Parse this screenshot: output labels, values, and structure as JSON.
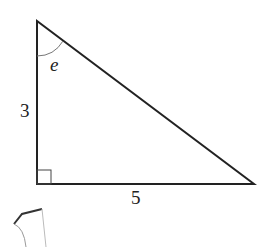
{
  "diagram": {
    "type": "right-triangle",
    "labels": {
      "vertical_side": "3",
      "horizontal_side": "5",
      "angle": "e"
    },
    "vertices": {
      "top": [
        37,
        21
      ],
      "right_angle": [
        37,
        184
      ],
      "right": [
        254,
        184
      ]
    },
    "right_angle_marker": true,
    "colors": {
      "stroke": "#222222",
      "arc": "#777777"
    }
  }
}
